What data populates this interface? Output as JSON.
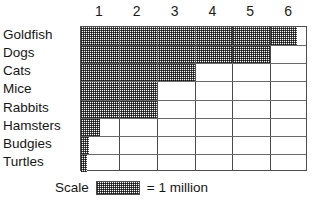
{
  "chart_data": {
    "type": "bar",
    "orientation": "horizontal",
    "title": "",
    "xlabel": "",
    "ylabel": "",
    "categories": [
      "Goldfish",
      "Dogs",
      "Cats",
      "Mice",
      "Rabbits",
      "Hamsters",
      "Budgies",
      "Turtles"
    ],
    "values": [
      5.7,
      5.0,
      3.0,
      2.0,
      2.0,
      0.5,
      0.2,
      0.15
    ],
    "unit": "million",
    "xticklabels": [
      "1",
      "2",
      "3",
      "4",
      "5",
      "6"
    ],
    "xtickvalues": [
      1,
      2,
      3,
      4,
      5,
      6
    ],
    "xlim": [
      0,
      6
    ],
    "grid": true,
    "legend_position": "bottom",
    "scale_note": "1 square = 1 million",
    "fill_style": "dotted-gray-hatch"
  },
  "axis": {
    "columns": [
      {
        "label": "1"
      },
      {
        "label": "2"
      },
      {
        "label": "3"
      },
      {
        "label": "4"
      },
      {
        "label": "5"
      },
      {
        "label": "6"
      }
    ]
  },
  "rows": [
    {
      "label": "Goldfish",
      "value": 5.7
    },
    {
      "label": "Dogs",
      "value": 5.0
    },
    {
      "label": "Cats",
      "value": 3.0
    },
    {
      "label": "Mice",
      "value": 2.0
    },
    {
      "label": "Rabbits",
      "value": 2.0
    },
    {
      "label": "Hamsters",
      "value": 0.5
    },
    {
      "label": "Budgies",
      "value": 0.2
    },
    {
      "label": "Turtles",
      "value": 0.15
    }
  ],
  "legend": {
    "scale_label": "Scale",
    "equals_label": "= 1 million"
  },
  "colors": {
    "fill": "#808080",
    "grid_line": "#4a4a4a",
    "border": "#4d4d4d",
    "text": "#161616",
    "background": "#ffffff"
  }
}
